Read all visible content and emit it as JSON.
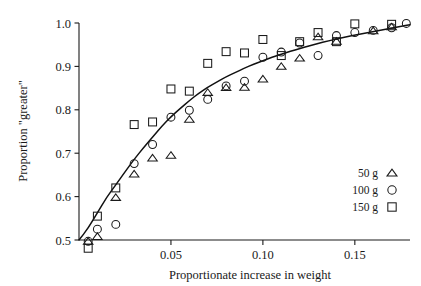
{
  "chart_data": {
    "type": "scatter",
    "title": "",
    "xlabel": "Proportionate increase in weight",
    "ylabel": "Proportion \"greater\"",
    "xlim": [
      -0.004,
      0.182
    ],
    "ylim": [
      0.475,
      1.005
    ],
    "xticks": [
      0.05,
      0.1,
      0.15
    ],
    "xticklabels": [
      "0.05",
      "0.10",
      "0.15"
    ],
    "yticks": [
      0.5,
      0.6,
      0.7,
      0.8,
      0.9,
      1.0
    ],
    "yticklabels": [
      "0.5",
      "0.6",
      "0.7",
      "0.8",
      "0.9",
      "1.0"
    ],
    "grid": false,
    "legend_position": "center-right",
    "series": [
      {
        "name": "50 g",
        "marker": "triangle",
        "points": [
          [
            0.005,
            0.497
          ],
          [
            0.01,
            0.508
          ],
          [
            0.02,
            0.598
          ],
          [
            0.03,
            0.652
          ],
          [
            0.04,
            0.689
          ],
          [
            0.05,
            0.695
          ],
          [
            0.06,
            0.778
          ],
          [
            0.07,
            0.84
          ],
          [
            0.08,
            0.851
          ],
          [
            0.09,
            0.852
          ],
          [
            0.1,
            0.871
          ],
          [
            0.11,
            0.9
          ],
          [
            0.12,
            0.919
          ],
          [
            0.13,
            0.968
          ],
          [
            0.14,
            0.958
          ],
          [
            0.16,
            0.982
          ],
          [
            0.17,
            0.991
          ]
        ]
      },
      {
        "name": "100 g",
        "marker": "circle",
        "points": [
          [
            0.005,
            0.497
          ],
          [
            0.01,
            0.525
          ],
          [
            0.02,
            0.536
          ],
          [
            0.03,
            0.676
          ],
          [
            0.04,
            0.72
          ],
          [
            0.05,
            0.783
          ],
          [
            0.06,
            0.799
          ],
          [
            0.07,
            0.824
          ],
          [
            0.08,
            0.855
          ],
          [
            0.09,
            0.866
          ],
          [
            0.1,
            0.921
          ],
          [
            0.11,
            0.933
          ],
          [
            0.12,
            0.954
          ],
          [
            0.13,
            0.925
          ],
          [
            0.14,
            0.971
          ],
          [
            0.15,
            0.978
          ],
          [
            0.16,
            0.983
          ],
          [
            0.17,
            0.989
          ],
          [
            0.178,
            0.999
          ]
        ]
      },
      {
        "name": "150 g",
        "marker": "square",
        "points": [
          [
            0.005,
            0.481
          ],
          [
            0.01,
            0.555
          ],
          [
            0.02,
            0.62
          ],
          [
            0.03,
            0.766
          ],
          [
            0.04,
            0.772
          ],
          [
            0.05,
            0.848
          ],
          [
            0.06,
            0.843
          ],
          [
            0.07,
            0.907
          ],
          [
            0.08,
            0.934
          ],
          [
            0.09,
            0.931
          ],
          [
            0.1,
            0.962
          ],
          [
            0.11,
            0.925
          ],
          [
            0.12,
            0.957
          ],
          [
            0.13,
            0.978
          ],
          [
            0.14,
            0.957
          ],
          [
            0.15,
            0.998
          ],
          [
            0.17,
            0.997
          ]
        ]
      }
    ],
    "fit_curve": {
      "name": "fitted ogive",
      "points": [
        [
          0.0,
          0.5
        ],
        [
          0.005,
          0.527
        ],
        [
          0.01,
          0.563
        ],
        [
          0.015,
          0.598
        ],
        [
          0.02,
          0.627
        ],
        [
          0.025,
          0.657
        ],
        [
          0.03,
          0.686
        ],
        [
          0.035,
          0.712
        ],
        [
          0.04,
          0.737
        ],
        [
          0.045,
          0.762
        ],
        [
          0.05,
          0.784
        ],
        [
          0.055,
          0.803
        ],
        [
          0.06,
          0.821
        ],
        [
          0.065,
          0.838
        ],
        [
          0.07,
          0.852
        ],
        [
          0.075,
          0.864
        ],
        [
          0.08,
          0.876
        ],
        [
          0.085,
          0.886
        ],
        [
          0.09,
          0.896
        ],
        [
          0.095,
          0.905
        ],
        [
          0.1,
          0.913
        ],
        [
          0.105,
          0.921
        ],
        [
          0.11,
          0.928
        ],
        [
          0.115,
          0.935
        ],
        [
          0.12,
          0.941
        ],
        [
          0.125,
          0.947
        ],
        [
          0.13,
          0.953
        ],
        [
          0.135,
          0.958
        ],
        [
          0.14,
          0.963
        ],
        [
          0.145,
          0.968
        ],
        [
          0.15,
          0.972
        ],
        [
          0.155,
          0.976
        ],
        [
          0.16,
          0.98
        ],
        [
          0.165,
          0.984
        ],
        [
          0.17,
          0.988
        ],
        [
          0.175,
          0.992
        ],
        [
          0.18,
          0.996
        ]
      ]
    },
    "colors": {
      "ink": "#1a1a1a",
      "background": "#ffffff",
      "curve": "#111111"
    }
  },
  "legend": {
    "entries": [
      {
        "label": "50 g",
        "marker": "triangle"
      },
      {
        "label": "100 g",
        "marker": "circle"
      },
      {
        "label": "150 g",
        "marker": "square"
      }
    ]
  }
}
